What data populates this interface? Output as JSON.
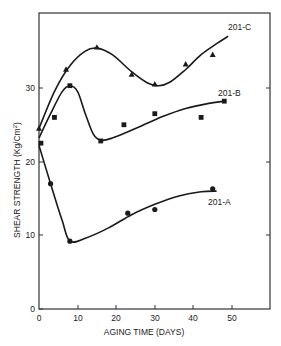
{
  "chart_data": {
    "type": "line",
    "title": "",
    "xlabel": "AGING TIME (DAYS)",
    "ylabel": "SHEAR STRENGTH (Kg/Cm²)",
    "xlim": [
      0,
      60
    ],
    "ylim": [
      0,
      37
    ],
    "xticks": [
      0,
      10,
      20,
      30,
      40,
      50
    ],
    "yticks": [
      0,
      10,
      20,
      30
    ],
    "grid": false,
    "legend": "inline labels at curve ends",
    "series": [
      {
        "name": "201-C",
        "marker": "triangle",
        "points": [
          [
            0,
            24.5
          ],
          [
            7,
            32.5
          ],
          [
            15,
            35.5
          ],
          [
            24,
            31.8
          ],
          [
            30,
            30.5
          ],
          [
            38,
            33.2
          ],
          [
            45,
            34.5
          ]
        ],
        "curve": [
          [
            0,
            24.5
          ],
          [
            4,
            29.5
          ],
          [
            8,
            33.0
          ],
          [
            12,
            35.0
          ],
          [
            15,
            35.4
          ],
          [
            19,
            34.5
          ],
          [
            24,
            32.2
          ],
          [
            28,
            30.7
          ],
          [
            31,
            30.3
          ],
          [
            34,
            30.8
          ],
          [
            38,
            32.5
          ],
          [
            42,
            34.5
          ],
          [
            46,
            36.0
          ],
          [
            49,
            37.0
          ]
        ]
      },
      {
        "name": "201-B",
        "marker": "square",
        "points": [
          [
            0.5,
            22.5
          ],
          [
            4,
            26
          ],
          [
            8,
            30.3
          ],
          [
            16,
            22.8
          ],
          [
            22,
            25
          ],
          [
            30,
            26.5
          ],
          [
            42,
            26
          ],
          [
            48,
            28.2
          ]
        ],
        "curve": [
          [
            0,
            23.2
          ],
          [
            3,
            26.5
          ],
          [
            6,
            29.5
          ],
          [
            8,
            30.3
          ],
          [
            10,
            29.5
          ],
          [
            12,
            26.5
          ],
          [
            14,
            23.8
          ],
          [
            16,
            22.9
          ],
          [
            19,
            23.2
          ],
          [
            25,
            24.5
          ],
          [
            32,
            26.1
          ],
          [
            38,
            27.2
          ],
          [
            44,
            27.9
          ],
          [
            48,
            28.2
          ]
        ]
      },
      {
        "name": "201-A",
        "marker": "circle",
        "points": [
          [
            3,
            17
          ],
          [
            8,
            9.2
          ],
          [
            23,
            13
          ],
          [
            30,
            13.5
          ],
          [
            45,
            16.3
          ]
        ],
        "curve": [
          [
            0,
            22.2
          ],
          [
            3,
            17.0
          ],
          [
            6,
            12.0
          ],
          [
            8,
            9.2
          ],
          [
            12,
            9.6
          ],
          [
            18,
            11.0
          ],
          [
            24,
            12.8
          ],
          [
            30,
            14.2
          ],
          [
            36,
            15.3
          ],
          [
            42,
            15.9
          ],
          [
            46,
            16.0
          ]
        ]
      }
    ]
  },
  "labels": {
    "series_c": "201-C",
    "series_b": "201-B",
    "series_a": "201-A",
    "xlabel": "AGING TIME (DAYS)",
    "ylabel": "SHEAR STRENGTH (Kg/Cm",
    "ylabel_sup": "2",
    "ylabel_close": ")",
    "xtick_0": "0",
    "xtick_10": "10",
    "xtick_20": "20",
    "xtick_30": "30",
    "xtick_40": "40",
    "xtick_50": "50",
    "ytick_0": "0",
    "ytick_10": "10",
    "ytick_20": "20",
    "ytick_30": "30"
  },
  "colors": {
    "ink": "#1a1a1a",
    "background": "#ffffff",
    "axis": "#333333"
  }
}
